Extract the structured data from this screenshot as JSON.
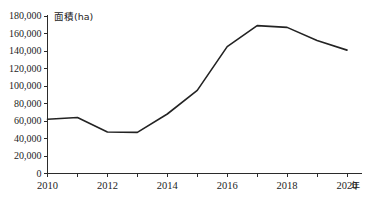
{
  "chart_data": {
    "type": "line",
    "title": "",
    "subtitle": "",
    "xlabel": "年",
    "ylabel": "面積(ha)",
    "y_axis_label_text": "面積(ha)",
    "x_axis_unit_text": "年",
    "categories": [
      2010,
      2011,
      2012,
      2013,
      2014,
      2015,
      2016,
      2017,
      2018,
      2019,
      2020
    ],
    "x": [
      2010,
      2011,
      2012,
      2013,
      2014,
      2015,
      2016,
      2017,
      2018,
      2019,
      2020
    ],
    "values": [
      62000,
      64000,
      47500,
      47000,
      68000,
      95000,
      145000,
      169000,
      167000,
      152000,
      141000
    ],
    "series": [
      {
        "name": "面積(ha)",
        "values": [
          62000,
          64000,
          47500,
          47000,
          68000,
          95000,
          145000,
          169000,
          167000,
          152000,
          141000
        ]
      }
    ],
    "xlim": [
      2010,
      2020
    ],
    "ylim": [
      0,
      180000
    ],
    "y_tick_step": 20000,
    "x_tick_step": 1,
    "grid": false,
    "legend": false,
    "legend_position": "none",
    "line_color": "#232323",
    "background_color": "#ffffff",
    "y_tick_labels": [
      "0",
      "20,000",
      "40,000",
      "60,000",
      "80,000",
      "100,000",
      "120,000",
      "140,000",
      "160,000",
      "180,000"
    ],
    "y_tick_values": [
      0,
      20000,
      40000,
      60000,
      80000,
      100000,
      120000,
      140000,
      160000,
      180000
    ],
    "x_tick_labels": [
      "2010",
      "",
      "2012",
      "",
      "2014",
      "",
      "2016",
      "",
      "2018",
      "",
      "2020"
    ],
    "x_tick_values": [
      2010,
      2011,
      2012,
      2013,
      2014,
      2015,
      2016,
      2017,
      2018,
      2019,
      2020
    ],
    "x_labeled_ticks": [
      {
        "value": 2010,
        "label": "2010"
      },
      {
        "value": 2012,
        "label": "2012"
      },
      {
        "value": 2014,
        "label": "2014"
      },
      {
        "value": 2016,
        "label": "2016"
      },
      {
        "value": 2018,
        "label": "2018"
      },
      {
        "value": 2020,
        "label": "2020"
      }
    ]
  }
}
